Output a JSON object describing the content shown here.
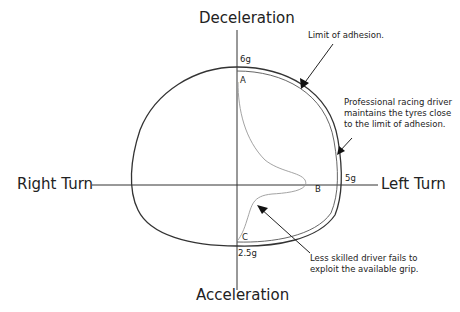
{
  "diagram": {
    "axes": {
      "top": "Deceleration",
      "bottom": "Acceleration",
      "left": "Right Turn",
      "right": "Left Turn"
    },
    "values": {
      "top": "6g",
      "right": "5g",
      "bottom": "2.5g"
    },
    "points": {
      "a": "A",
      "b": "B",
      "c": "C"
    },
    "annotations": {
      "limit": "Limit of adhesion.",
      "pro_line1": "Professional racing driver",
      "pro_line2": "maintains the tyres close",
      "pro_line3": "to the limit of adhesion.",
      "less_line1": "Less skilled driver fails to",
      "less_line2": "exploit the available grip."
    },
    "colors": {
      "outline": "#333333",
      "driver_curve": "#999999",
      "text": "#222222"
    }
  }
}
